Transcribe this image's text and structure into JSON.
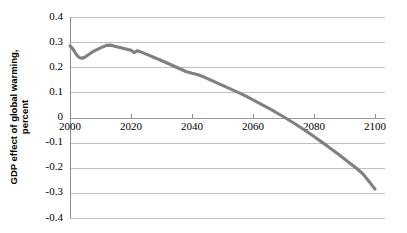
{
  "chart_data": {
    "type": "line",
    "title": "",
    "subtitle": "",
    "xlabel": "",
    "ylabel": "GDP effect of global warming, percent",
    "ylabel_line1": "GDP effect of global warming,",
    "ylabel_line2": "percent",
    "xlim": [
      2000,
      2100
    ],
    "ylim": [
      -0.4,
      0.4
    ],
    "grid": true,
    "legend": "none",
    "line_color": "#808080",
    "gridline_color": "#bfbfbf",
    "axis_color": "#8c8c8c",
    "xticks": [
      2000,
      2020,
      2040,
      2060,
      2080,
      2100
    ],
    "xtick_labels": [
      "2000",
      "2020",
      "2040",
      "2060",
      "2080",
      "2100"
    ],
    "yticks": [
      0.4,
      0.3,
      0.2,
      0.1,
      0,
      -0.1,
      -0.2,
      -0.3,
      -0.4
    ],
    "ytick_labels": [
      "0.4",
      "0.3",
      "0.2",
      "0.1",
      "0",
      "-0.1",
      "-0.2",
      "-0.3",
      "-0.4"
    ],
    "series": [
      {
        "name": "GDP effect of global warming",
        "x": [
          2000,
          2001,
          2002,
          2003,
          2004,
          2005,
          2006,
          2007,
          2008,
          2009,
          2010,
          2011,
          2012,
          2013,
          2014,
          2015,
          2016,
          2017,
          2018,
          2019,
          2020,
          2021,
          2022,
          2023,
          2024,
          2025,
          2026,
          2027,
          2028,
          2029,
          2030,
          2032,
          2034,
          2036,
          2038,
          2040,
          2042,
          2044,
          2046,
          2048,
          2050,
          2052,
          2054,
          2056,
          2058,
          2060,
          2062,
          2064,
          2066,
          2068,
          2070,
          2072,
          2074,
          2076,
          2078,
          2080,
          2082,
          2084,
          2086,
          2088,
          2090,
          2092,
          2094,
          2096,
          2098,
          2100
        ],
        "y": [
          0.285,
          0.272,
          0.252,
          0.239,
          0.236,
          0.241,
          0.25,
          0.258,
          0.265,
          0.271,
          0.277,
          0.282,
          0.287,
          0.288,
          0.286,
          0.283,
          0.28,
          0.277,
          0.274,
          0.271,
          0.268,
          0.258,
          0.266,
          0.262,
          0.257,
          0.252,
          0.247,
          0.242,
          0.237,
          0.232,
          0.227,
          0.216,
          0.205,
          0.194,
          0.183,
          0.176,
          0.17,
          0.161,
          0.15,
          0.139,
          0.128,
          0.117,
          0.106,
          0.095,
          0.083,
          0.07,
          0.057,
          0.044,
          0.031,
          0.017,
          0.003,
          -0.012,
          -0.027,
          -0.043,
          -0.059,
          -0.076,
          -0.093,
          -0.11,
          -0.128,
          -0.146,
          -0.165,
          -0.184,
          -0.203,
          -0.224,
          -0.254,
          -0.285
        ]
      }
    ],
    "annotations": []
  }
}
